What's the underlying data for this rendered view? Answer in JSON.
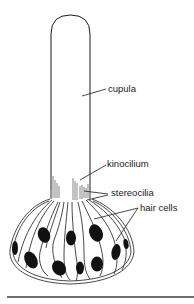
{
  "diagram": {
    "labels": {
      "cupula": "cupula",
      "kinocilium": "kinocilium",
      "stereocilia": "stereocilia",
      "hair_cells": "hair cells"
    },
    "colors": {
      "line": "#1a1a1a",
      "nucleus": "#111111",
      "background": "#ffffff",
      "rule": "#6e6e6e"
    }
  }
}
